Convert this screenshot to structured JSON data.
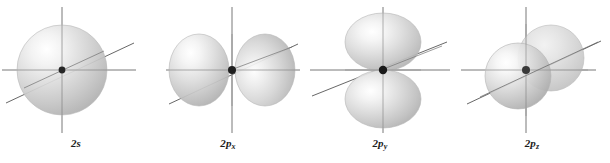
{
  "figure": {
    "background_color": "#ffffff",
    "width": 610,
    "height": 163,
    "axis_color": "#565656",
    "nucleus_color": "#262626",
    "lobe_fill_light": "#ffffff",
    "lobe_fill_mid": "#d6d6d6",
    "lobe_fill_dark": "#9f9f9f",
    "lobe_stroke": "#b4b4b4"
  },
  "orbitals": [
    {
      "id": "2s",
      "label_main": "2",
      "label_italic": "s",
      "label_sub": "",
      "shape": "sphere",
      "center_x": 62,
      "center_y": 70,
      "axes": [
        "vertical",
        "horizontal",
        "diagonal"
      ],
      "panel_left": 0
    },
    {
      "id": "2px",
      "label_main": "2",
      "label_italic": "p",
      "label_sub": "x",
      "shape": "two-lobes-horizontal",
      "center_x": 80,
      "center_y": 70,
      "axes": [
        "vertical",
        "horizontal",
        "diagonal"
      ],
      "panel_left": 152
    },
    {
      "id": "2py",
      "label_main": "2",
      "label_italic": "p",
      "label_sub": "y",
      "shape": "two-lobes-vertical",
      "center_x": 79,
      "center_y": 70,
      "axes": [
        "vertical",
        "horizontal",
        "diagonal"
      ],
      "panel_left": 304
    },
    {
      "id": "2pz",
      "label_main": "2",
      "label_italic": "p",
      "label_sub": "z",
      "shape": "two-lobes-diagonal",
      "center_x": 70,
      "center_y": 70,
      "axes": [
        "vertical",
        "horizontal",
        "diagonal"
      ],
      "panel_left": 456
    }
  ]
}
